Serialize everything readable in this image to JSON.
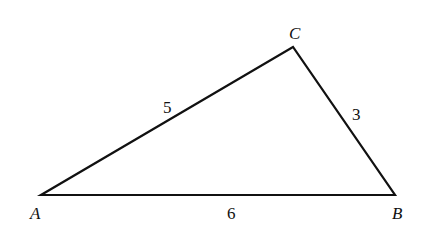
{
  "diagram": {
    "type": "triangle",
    "vertices": [
      {
        "name": "A",
        "x": 41,
        "y": 195,
        "label": "A",
        "label_x": 30,
        "label_y": 219
      },
      {
        "name": "B",
        "x": 395,
        "y": 195,
        "label": "B",
        "label_x": 392,
        "label_y": 219
      },
      {
        "name": "C",
        "x": 293,
        "y": 47,
        "label": "C",
        "label_x": 289,
        "label_y": 39
      }
    ],
    "sides": [
      {
        "name": "AC",
        "length_label": "5",
        "label_x": 163,
        "label_y": 113
      },
      {
        "name": "CB",
        "length_label": "3",
        "label_x": 352,
        "label_y": 120
      },
      {
        "name": "AB",
        "length_label": "6",
        "label_x": 227,
        "label_y": 219
      }
    ],
    "stroke_color": "#111111"
  }
}
